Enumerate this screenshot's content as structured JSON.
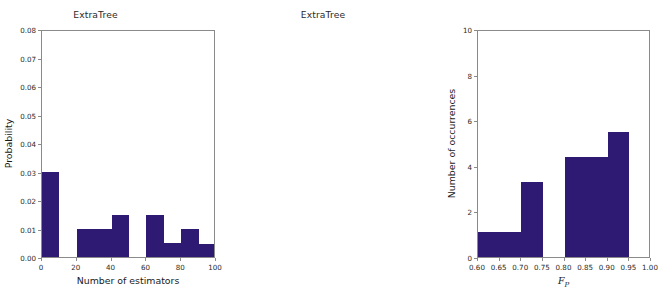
{
  "figure": {
    "bar_color": "#2e1a72",
    "axis_color": "#8a8a8a",
    "background": "#ffffff"
  },
  "panels": [
    {
      "id": "left",
      "title": "ExtraTree",
      "ylabel": "Probability",
      "xlabel": "Number of estimators",
      "ytick_labels": [
        "0.00",
        "0.01",
        "0.02",
        "0.03",
        "0.04",
        "0.05",
        "0.06",
        "0.07",
        "0.08"
      ],
      "xtick_labels": [
        "0",
        "20",
        "40",
        "60",
        "80",
        "100"
      ]
    },
    {
      "id": "right",
      "title": "ExtraTree",
      "ylabel": "Number of occurrences",
      "xlabel_main": "F",
      "xlabel_sub": "P",
      "ytick_labels": [
        "0",
        "2",
        "4",
        "6",
        "8",
        "10"
      ],
      "xtick_labels": [
        "0.60",
        "0.65",
        "0.70",
        "0.75",
        "0.80",
        "0.85",
        "0.90",
        "0.95",
        "1.00"
      ]
    }
  ],
  "chart_data": [
    {
      "type": "bar",
      "title": "ExtraTree",
      "xlabel": "Number of estimators",
      "ylabel": "Probability",
      "xlim": [
        0,
        100
      ],
      "ylim": [
        0.0,
        0.08
      ],
      "xticks": [
        0,
        20,
        40,
        60,
        80,
        100
      ],
      "yticks": [
        0.0,
        0.01,
        0.02,
        0.03,
        0.04,
        0.05,
        0.06,
        0.07,
        0.08
      ],
      "grid": false,
      "legend": "none",
      "bin_edges": [
        0,
        10,
        20,
        30,
        40,
        50,
        60,
        70,
        80,
        90,
        100
      ],
      "bin_labels": [
        "0-10",
        "10-20",
        "20-30",
        "30-40",
        "40-50",
        "50-60",
        "60-70",
        "70-80",
        "80-90",
        "90-100"
      ],
      "values": [
        0.03,
        0.0,
        0.01,
        0.01,
        0.0148,
        0.0,
        0.0148,
        0.0049,
        0.0098,
        0.0045
      ]
    },
    {
      "type": "bar",
      "title": "ExtraTree",
      "xlabel": "F_P",
      "ylabel": "Number of occurrences",
      "xlim": [
        0.6,
        1.0
      ],
      "ylim": [
        0,
        10
      ],
      "xticks": [
        0.6,
        0.65,
        0.7,
        0.75,
        0.8,
        0.85,
        0.9,
        0.95,
        1.0
      ],
      "yticks": [
        0,
        2,
        4,
        6,
        8,
        10
      ],
      "grid": false,
      "legend": "none",
      "bin_edges": [
        0.6,
        0.65,
        0.7,
        0.75,
        0.8,
        0.85,
        0.9,
        0.95,
        1.0
      ],
      "bin_labels": [
        "0.60-0.65",
        "0.65-0.70",
        "0.70-0.75",
        "0.75-0.80",
        "0.80-0.85",
        "0.85-0.90",
        "0.90-0.95",
        "0.95-1.00"
      ],
      "values": [
        1.1,
        1.1,
        3.3,
        0.0,
        4.4,
        4.4,
        5.5,
        0.0
      ]
    }
  ]
}
